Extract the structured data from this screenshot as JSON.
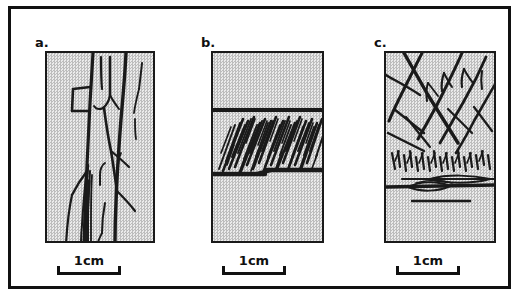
{
  "figure": {
    "type": "line-drawing-plate",
    "background_color": "#ffffff",
    "frame_color": "#111111",
    "stipple_fill_color": "#d9d9d9",
    "ink_color": "#1a1a1a",
    "panel_count": 3
  },
  "panels": [
    {
      "label": "a.",
      "name": "panel-a",
      "description": "Stippled rectangular block with sub-vertical branching tree-like traces",
      "scalebar": {
        "label": "1cm"
      }
    },
    {
      "label": "b.",
      "name": "panel-b",
      "description": "Stippled rectangular block with a horizontal band bounded by thick lines, filled with dense inclined hatching",
      "scalebar": {
        "label": "1cm"
      }
    },
    {
      "label": "c.",
      "name": "panel-c",
      "description": "Stippled rectangular block with diagonal branching traces terminating downward at a horizontal lenticular boundary",
      "scalebar": {
        "label": "1cm"
      }
    }
  ]
}
